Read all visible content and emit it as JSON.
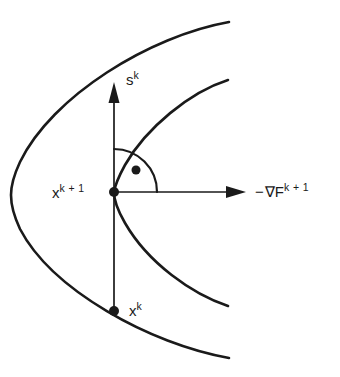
{
  "figure": {
    "kind": "mathematical-diagram",
    "background_color": "#ffffff",
    "ink_color": "#1a1a1a",
    "width": 340,
    "height": 377
  },
  "labels": {
    "search_direction": {
      "base": "s",
      "exponent": "k",
      "full": "s^k"
    },
    "current_point": {
      "base": "x",
      "exponent": "k + 1",
      "full": "x^k+1"
    },
    "previous_point": {
      "base": "x",
      "exponent": "k",
      "full": "x^k"
    },
    "negative_gradient": {
      "minus": "−",
      "nabla": "∇",
      "base": "F",
      "exponent": "k + 1",
      "full": "−∇F^k+1"
    }
  },
  "points": [
    {
      "name": "x-k-plus-1",
      "label": "x^k+1",
      "x": 114,
      "y": 192,
      "radius": 5
    },
    {
      "name": "x-k",
      "label": "x^k",
      "x": 114,
      "y": 311,
      "radius": 5
    },
    {
      "name": "right-angle-marker-dot",
      "label": "",
      "x": 136,
      "y": 170,
      "radius": 4.5
    }
  ],
  "arrows": [
    {
      "name": "s-k-arrow",
      "from": [
        114,
        311
      ],
      "to": [
        114,
        82
      ],
      "direction": "up",
      "label": "s^k"
    },
    {
      "name": "negative-gradient-arrow",
      "from": [
        114,
        192
      ],
      "to": [
        246,
        192
      ],
      "direction": "right",
      "label": "−∇F^k+1"
    }
  ],
  "angle_marker": {
    "name": "right-angle-arc",
    "vertex": [
      114,
      192
    ],
    "radius": 43,
    "start_angle_deg": 90,
    "end_angle_deg": 0,
    "indicates": "90 degrees"
  },
  "curves": [
    {
      "name": "outer-contour",
      "type": "parabola-opening-right",
      "vertex": [
        11,
        195
      ],
      "upper_endpoint": [
        229,
        22
      ],
      "lower_endpoint": [
        229,
        358
      ]
    },
    {
      "name": "inner-contour",
      "type": "parabola-opening-right",
      "vertex": [
        114,
        192
      ],
      "upper_endpoint": [
        228,
        80
      ],
      "lower_endpoint": [
        228,
        306
      ]
    }
  ]
}
